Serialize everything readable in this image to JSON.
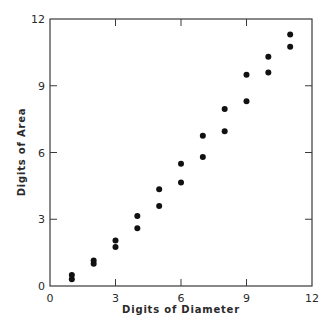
{
  "chart_data": {
    "type": "scatter",
    "title": "",
    "xlabel": "Digits of Diameter",
    "ylabel": "Digits of Area",
    "xlim": [
      0,
      12
    ],
    "ylim": [
      0,
      12
    ],
    "xticks": [
      0,
      3,
      6,
      9,
      12
    ],
    "yticks": [
      0,
      3,
      6,
      9,
      12
    ],
    "grid": false,
    "legend": null,
    "series": [
      {
        "name": "points",
        "color": "#111111",
        "points": [
          {
            "x": 1,
            "y": 0.5
          },
          {
            "x": 1,
            "y": 0.3
          },
          {
            "x": 2,
            "y": 1.15
          },
          {
            "x": 2,
            "y": 1.0
          },
          {
            "x": 3,
            "y": 2.05
          },
          {
            "x": 3,
            "y": 1.75
          },
          {
            "x": 4,
            "y": 3.15
          },
          {
            "x": 4,
            "y": 2.6
          },
          {
            "x": 5,
            "y": 4.35
          },
          {
            "x": 5,
            "y": 3.6
          },
          {
            "x": 6,
            "y": 5.5
          },
          {
            "x": 6,
            "y": 4.65
          },
          {
            "x": 7,
            "y": 6.75
          },
          {
            "x": 7,
            "y": 5.8
          },
          {
            "x": 8,
            "y": 7.95
          },
          {
            "x": 8,
            "y": 6.95
          },
          {
            "x": 9,
            "y": 9.5
          },
          {
            "x": 9,
            "y": 8.3
          },
          {
            "x": 10,
            "y": 10.3
          },
          {
            "x": 10,
            "y": 9.6
          },
          {
            "x": 11,
            "y": 11.3
          },
          {
            "x": 11,
            "y": 10.75
          }
        ]
      }
    ]
  },
  "style": {
    "axis_color": "#3a3a3a",
    "point_color": "#111111",
    "background": "#ffffff"
  }
}
